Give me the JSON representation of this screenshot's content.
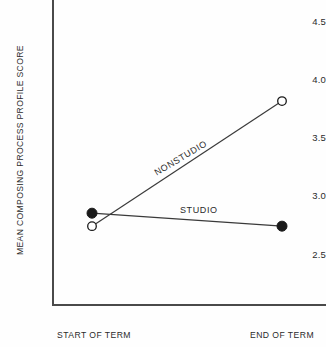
{
  "chart_data": {
    "type": "line",
    "title": "",
    "xlabel": "",
    "ylabel": "MEAN COMPOSING PROCESS PROFILE SCORE",
    "categories": [
      "START OF TERM",
      "END OF TERM"
    ],
    "x": [
      0,
      1
    ],
    "ylim": [
      2.3,
      4.65
    ],
    "yticks": [
      2.5,
      3.0,
      3.5,
      4.0,
      4.5
    ],
    "ytick_labels": [
      "2.5",
      "3.0",
      "3.5",
      "4.0",
      "4.5"
    ],
    "grid": false,
    "legend_position": "inline-annotation",
    "series": [
      {
        "name": "STUDIO",
        "values": [
          2.99,
          2.88
        ],
        "marker": "filled-circle",
        "label": "STUDIO"
      },
      {
        "name": "NONSTUDIO",
        "values": [
          2.88,
          3.94
        ],
        "marker": "open-circle",
        "label": "NONSTUDIO"
      }
    ],
    "annotations": [
      "STUDIO",
      "NONSTUDIO"
    ],
    "colors": {
      "line": "#3a3a3a",
      "axis": "#4a4a4a",
      "marker_fill": "#1a1a1a",
      "marker_open_fill": "#ffffff",
      "text": "#2b2b2b",
      "background": "#fefefe"
    }
  },
  "axes": {
    "y_title": "MEAN COMPOSING PROCESS PROFILE SCORE",
    "y_ticks": [
      {
        "label": "4.5",
        "top": 16
      },
      {
        "label": "4.0",
        "top": 74
      },
      {
        "label": "3.5",
        "top": 132
      },
      {
        "label": "3.0",
        "top": 190
      },
      {
        "label": "2.5",
        "top": 249
      }
    ],
    "x_ticks": [
      {
        "label": "START OF TERM"
      },
      {
        "label": "END OF TERM"
      }
    ]
  },
  "labels": {
    "nonstudio": "NONSTUDIO",
    "studio": "STUDIO"
  }
}
